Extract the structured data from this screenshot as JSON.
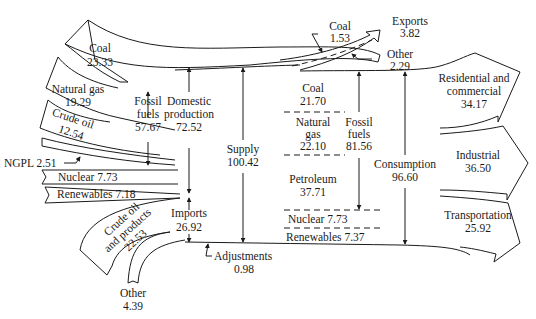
{
  "sources": {
    "coal": {
      "label": "Coal",
      "value": "23.33"
    },
    "natural_gas": {
      "label": "Natural gas",
      "value": "19.29"
    },
    "crude_oil": {
      "label": "Crude oil",
      "value": "12.54"
    },
    "ngpl": {
      "label": "NGPL 2.51"
    },
    "nuclear": {
      "label": "Nuclear 7.73"
    },
    "renewables": {
      "label": "Renewables 7.18"
    }
  },
  "fossil_fuels_production": {
    "line1": "Fossil",
    "line2": "fuels",
    "value": "57.67"
  },
  "domestic_production": {
    "line1": "Domestic",
    "line2": "production",
    "value": "72.52"
  },
  "imports": {
    "label": "Imports",
    "value": "26.92",
    "crude_oil_products": {
      "line1": "Crude oil",
      "line2": "and products",
      "value": "22.53"
    },
    "other": {
      "label": "Other",
      "value": "4.39"
    }
  },
  "supply": {
    "label": "Supply",
    "value": "100.42"
  },
  "adjustments": {
    "label": "Adjustments",
    "value": "0.98"
  },
  "exports": {
    "label": "Exports",
    "value": "3.82",
    "coal": {
      "label": "Coal",
      "value": "1.53"
    },
    "other": {
      "label": "Other",
      "value": "2.29"
    }
  },
  "consumption_mix": {
    "coal": {
      "label": "Coal",
      "value": "21.70"
    },
    "natural_gas": {
      "line1": "Natural",
      "line2": "gas",
      "value": "22.10"
    },
    "petroleum": {
      "label": "Petroleum",
      "value": "37.71"
    },
    "nuclear": {
      "label": "Nuclear 7.73"
    },
    "renewables": {
      "label": "Renewables 7.37"
    },
    "fossil_fuels": {
      "line1": "Fossil",
      "line2": "fuels",
      "value": "81.56"
    }
  },
  "consumption": {
    "label": "Consumption",
    "value": "96.60"
  },
  "sectors": {
    "residential": {
      "line1": "Residential and",
      "line2": "commercial",
      "value": "34.17"
    },
    "industrial": {
      "label": "Industrial",
      "value": "36.50"
    },
    "transportation": {
      "label": "Transportation",
      "value": "25.92"
    }
  }
}
